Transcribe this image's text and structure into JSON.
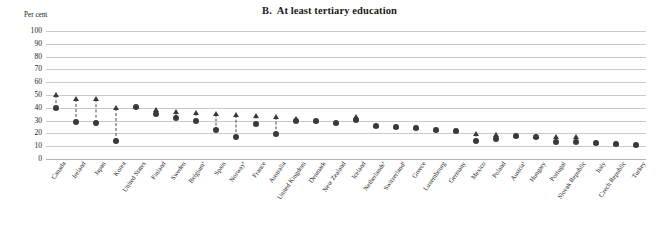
{
  "chart": {
    "title": "B.  At least tertiary education",
    "axis_unit_label": "Per cent",
    "footnote_marker": "¹"
  },
  "chart_data": {
    "type": "scatter",
    "title": "B.  At least tertiary education",
    "subtitle": "",
    "xlabel": "",
    "ylabel": "Per cent",
    "ylim": [
      0,
      100
    ],
    "yticks": [
      0,
      10,
      20,
      30,
      40,
      50,
      60,
      70,
      80,
      90,
      100
    ],
    "grid": true,
    "legend_position": "none",
    "categories": [
      "Canada",
      "Ireland",
      "Japan",
      "Korea",
      "United States",
      "Finland",
      "Sweden",
      "Belgium¹",
      "Spain",
      "Norway¹",
      "France",
      "Australia",
      "United Kingdom",
      "Denmark",
      "New Zealand",
      "Iceland",
      "Netherlands¹",
      "Switzerland¹",
      "Greece",
      "Luxembourg",
      "Germany",
      "Mexico",
      "Poland",
      "Austria¹",
      "Hungary",
      "Portugal",
      "Slovak Republic",
      "Italy",
      "Czech Republic",
      "Turkey"
    ],
    "series": [
      {
        "name": "circle",
        "marker": "circle",
        "values": [
          40,
          29,
          28.5,
          14,
          41,
          35.5,
          32,
          30,
          23,
          17,
          27,
          19.5,
          30,
          30,
          28,
          30.5,
          26,
          25,
          24,
          22.5,
          22,
          14,
          15.5,
          18,
          17.5,
          13,
          13,
          12.5,
          12,
          11
        ]
      },
      {
        "name": "triangle",
        "marker": "triangle",
        "values": [
          50,
          47,
          47,
          39.5,
          41,
          38,
          37,
          36,
          35,
          34.5,
          33.5,
          33,
          31.5,
          30,
          28,
          33,
          26,
          25,
          24,
          22.5,
          22,
          19.5,
          18.5,
          18,
          17.5,
          17.5,
          17,
          12.5,
          12,
          11
        ]
      }
    ]
  }
}
